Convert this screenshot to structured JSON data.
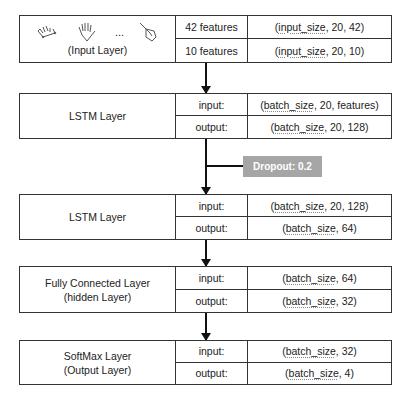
{
  "diagram": {
    "input_layer": {
      "name": "(Input Layer)",
      "icons": [
        "hand-gesture-icon-1",
        "open-hand-icon",
        "ellipsis",
        "pointing-hand-icon"
      ],
      "ellipsis": "...",
      "rows": [
        {
          "label": "42 features",
          "value_prefix": "(",
          "value_ul": "input_size",
          "value_suffix": ", 20, 42)"
        },
        {
          "label": "10 features",
          "value_prefix": "(",
          "value_ul": "input_size",
          "value_suffix": ", 20, 10)"
        }
      ]
    },
    "lstm1": {
      "name": "LSTM Layer",
      "rows": [
        {
          "label": "input:",
          "value_prefix": "(",
          "value_ul": "batch_size",
          "value_suffix": ", 20, features)"
        },
        {
          "label": "output:",
          "value_prefix": "(",
          "value_ul": "batch_size",
          "value_suffix": ", 20, 128)"
        }
      ]
    },
    "dropout": {
      "label": "Dropout: 0.2",
      "color": "#a6a6a6"
    },
    "lstm2": {
      "name": "LSTM Layer",
      "rows": [
        {
          "label": "input:",
          "value_prefix": "(",
          "value_ul": "batch_size",
          "value_suffix": ", 20, 128)"
        },
        {
          "label": "output:",
          "value_prefix": "(",
          "value_ul": "batch_size",
          "value_suffix": ", 64)"
        }
      ]
    },
    "fc": {
      "name_line1": "Fully Connected Layer",
      "name_line2": "(hidden Layer)",
      "rows": [
        {
          "label": "input:",
          "value_prefix": "(",
          "value_ul": "batch_size",
          "value_suffix": ", 64)"
        },
        {
          "label": "output:",
          "value_prefix": "(",
          "value_ul": "batch_size",
          "value_suffix": ", 32)"
        }
      ]
    },
    "softmax": {
      "name_line1": "SoftMax Layer",
      "name_line2": "(Output Layer)",
      "rows": [
        {
          "label": "input:",
          "value_prefix": "(",
          "value_ul": "batch_size",
          "value_suffix": ", 32)"
        },
        {
          "label": "output:",
          "value_prefix": "(",
          "value_ul": "batch_size",
          "value_suffix": ", 4)"
        }
      ]
    }
  }
}
